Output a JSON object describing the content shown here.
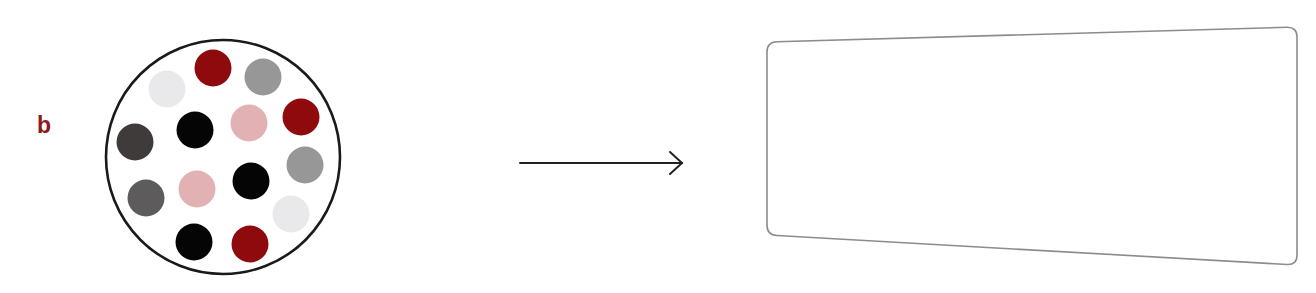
{
  "panel": {
    "label": "b",
    "label_color": "#8b1a1a"
  },
  "container": {
    "shape": "circle",
    "center": [
      223,
      157
    ],
    "radius": 117,
    "stroke": "#1a1a1a"
  },
  "colors": {
    "red": "#8e0a0c",
    "black": "#050505",
    "dark_gray": "#403b3b",
    "mid_dark_gray": "#5d5b5b",
    "gray": "#979797",
    "pink": "#e2b1b3",
    "light_gray": "#e9e9eb"
  },
  "dots": [
    {
      "cx": 167,
      "cy": 89,
      "color": "light_gray"
    },
    {
      "cx": 213,
      "cy": 68,
      "color": "red"
    },
    {
      "cx": 263,
      "cy": 77,
      "color": "gray"
    },
    {
      "cx": 135,
      "cy": 142,
      "color": "dark_gray"
    },
    {
      "cx": 195,
      "cy": 130,
      "color": "black"
    },
    {
      "cx": 249,
      "cy": 123,
      "color": "pink"
    },
    {
      "cx": 301,
      "cy": 117,
      "color": "red"
    },
    {
      "cx": 305,
      "cy": 165,
      "color": "gray"
    },
    {
      "cx": 251,
      "cy": 181,
      "color": "black"
    },
    {
      "cx": 197,
      "cy": 189,
      "color": "pink"
    },
    {
      "cx": 146,
      "cy": 198,
      "color": "mid_dark_gray"
    },
    {
      "cx": 291,
      "cy": 214,
      "color": "light_gray"
    },
    {
      "cx": 194,
      "cy": 242,
      "color": "black"
    },
    {
      "cx": 250,
      "cy": 244,
      "color": "red"
    }
  ],
  "dot_radius": 18.5,
  "arrow": {
    "from": [
      520,
      163
    ],
    "to": [
      682,
      163
    ],
    "color": "#222222"
  },
  "target_box": {
    "shape": "skewed-rounded-rectangle",
    "corners": {
      "top_left": [
        767,
        42
      ],
      "top_right": [
        1297,
        27
      ],
      "bottom_right": [
        1297,
        265
      ],
      "bottom_left": [
        767,
        235
      ]
    },
    "corner_radius": 10,
    "stroke": "#8c8c8c",
    "content": ""
  }
}
